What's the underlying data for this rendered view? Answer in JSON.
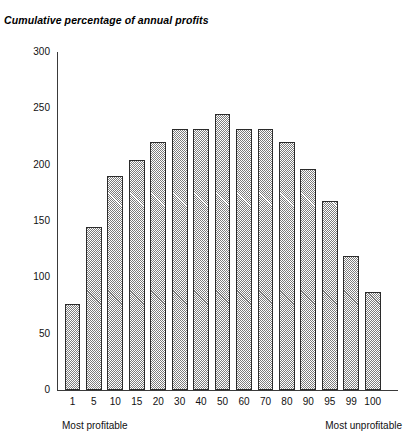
{
  "chart_data": {
    "type": "bar",
    "title": "Cumulative percentage of annual profits",
    "xlabel": "",
    "ylabel": "",
    "ylim": [
      0,
      300
    ],
    "yticks": [
      0,
      50,
      100,
      150,
      200,
      250,
      300
    ],
    "grid": false,
    "legend": null,
    "categories": [
      "1",
      "5",
      "10",
      "15",
      "20",
      "30",
      "40",
      "50",
      "60",
      "70",
      "80",
      "90",
      "95",
      "99",
      "100"
    ],
    "values": [
      76,
      145,
      190,
      204,
      220,
      232,
      232,
      245,
      232,
      232,
      220,
      196,
      168,
      119,
      87
    ],
    "annotations": [
      {
        "text": "Most profitable",
        "position": "below-axis-left"
      },
      {
        "text": "Most unprofitable",
        "position": "below-axis-right"
      }
    ],
    "bar_style": {
      "fill": "checkerboard-gray",
      "fill_color": "#7d7d7d",
      "edge_color": "#2b2b2b"
    },
    "axis_color": "#3a3a3a"
  }
}
